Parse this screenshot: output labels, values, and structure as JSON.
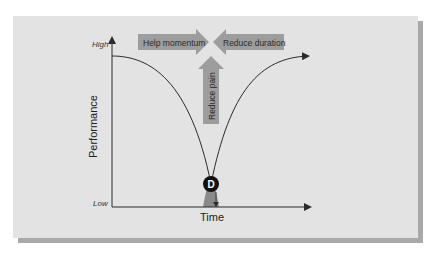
{
  "diagram": {
    "y_axis": {
      "label": "Performance",
      "high_label": "High",
      "low_label": "Low"
    },
    "x_axis": {
      "label": "Time"
    },
    "arrows": {
      "left": "Help momentum",
      "right": "Reduce duration",
      "up": "Reduce pain"
    },
    "marker": {
      "letter": "D"
    },
    "colors": {
      "panel": "#e3e3e3",
      "shadow": "#a9a9a9",
      "arrow_fill": "#9d9d9d",
      "dip_fill": "#8a8a8a",
      "line": "#2b2b2b"
    }
  }
}
